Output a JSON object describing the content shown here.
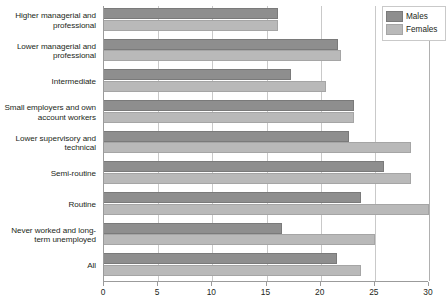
{
  "chart_data": {
    "type": "bar",
    "orientation": "horizontal",
    "title": "",
    "subtitle": "",
    "xlabel": "",
    "ylabel": "",
    "xlim": [
      0,
      30
    ],
    "xticks": [
      0,
      5,
      10,
      15,
      20,
      25,
      30
    ],
    "xtick_labels": [
      "0",
      "5",
      "10",
      "15",
      "20",
      "25",
      "30"
    ],
    "grid": "vertical",
    "legend_position": "top-right",
    "categories": [
      "Higher managerial and professional",
      "Lower managerial and professional",
      "Intermediate",
      "Small employers and own account workers",
      "Lower supervisory and technical",
      "Semi-routine",
      "Routine",
      "Never worked and long-term unemployed",
      "All"
    ],
    "category_lines": [
      [
        "Higher managerial and",
        "professional"
      ],
      [
        "Lower managerial and",
        "professional"
      ],
      [
        "Intermediate"
      ],
      [
        "Small employers and own",
        "account workers"
      ],
      [
        "Lower supervisory and",
        "technical"
      ],
      [
        "Semi-routine"
      ],
      [
        "Routine"
      ],
      [
        "Never worked and long-",
        "term unemployed"
      ],
      [
        "All"
      ]
    ],
    "series": [
      {
        "name": "Males",
        "color": "#8e8e8e",
        "values": [
          16.1,
          21.6,
          17.3,
          23.1,
          22.6,
          25.8,
          23.7,
          16.4,
          21.5
        ]
      },
      {
        "name": "Females",
        "color": "#b9b9b9",
        "values": [
          16.1,
          21.9,
          20.5,
          23.1,
          28.3,
          28.3,
          30.0,
          25.0,
          23.7
        ]
      }
    ]
  },
  "legend": {
    "items": [
      {
        "label": "Males",
        "key": "males"
      },
      {
        "label": "Females",
        "key": "females"
      }
    ]
  }
}
